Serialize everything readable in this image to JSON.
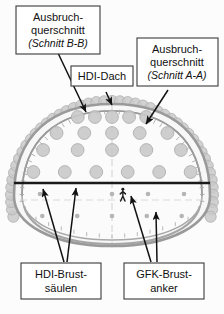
{
  "figure": {
    "type": "technical-cross-section-diagram"
  },
  "labels": {
    "top_left": {
      "name": "ausbruchquerschnitt-schnitt-bb",
      "line1": "Ausbruch-",
      "line2": "querschnitt",
      "line3": "(Schnitt B-B)"
    },
    "top_center": {
      "name": "hdi-dach",
      "line1": "HDI-Dach"
    },
    "top_right": {
      "name": "ausbruchquerschnitt-schnitt-aa",
      "line1": "Ausbruch-",
      "line2": "querschnitt",
      "line3": "(Schnitt A-A)"
    },
    "bottom_left": {
      "name": "hdi-brustsaeulen",
      "line1": "HDI-Brust-",
      "line2": "säulen"
    },
    "bottom_right": {
      "name": "gfk-brustanker",
      "line1": "GFK-Brust-",
      "line2": "anker"
    }
  },
  "colors": {
    "outline_grey": "#9a9a9a",
    "circle_fill": "#c9c9c9",
    "circle_stroke": "#b0b0b0",
    "dot_fill": "#b5b5b5",
    "excavation_line": "#1a1a1a",
    "box_border": "#3a3a3a",
    "box_fill": "#ffffff",
    "text": "#111111",
    "centerline": "#c0c0c0",
    "background": "#fcfcfc"
  },
  "chart_data": {
    "type": "scatter",
    "xlabel": "",
    "ylabel": "",
    "hdi_columns_rows": [
      {
        "row": 1,
        "count": 5,
        "y": 117
      },
      {
        "row": 2,
        "count": 5,
        "y": 133
      },
      {
        "row": 3,
        "count": 5,
        "y": 150
      },
      {
        "row": 4,
        "count": 6,
        "y": 172
      }
    ],
    "gfk_anchor_rows": [
      {
        "row": 1,
        "count": 5,
        "y": 194
      },
      {
        "row": 2,
        "count": 5,
        "y": 216
      }
    ],
    "crown_canopy_pipes": 46,
    "human_scale_figure": 1
  }
}
